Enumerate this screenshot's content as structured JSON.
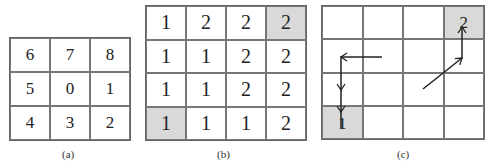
{
  "figure": {
    "panels": [
      {
        "id": "a",
        "caption": "(a)",
        "rows": 3,
        "cols": 3,
        "cells": [
          [
            "6",
            "7",
            "8"
          ],
          [
            "5",
            "0",
            "1"
          ],
          [
            "4",
            "3",
            "2"
          ]
        ],
        "shaded": []
      },
      {
        "id": "b",
        "caption": "(b)",
        "rows": 4,
        "cols": 4,
        "cells": [
          [
            "1",
            "2",
            "2",
            "2"
          ],
          [
            "1",
            "1",
            "2",
            "2"
          ],
          [
            "1",
            "1",
            "2",
            "2"
          ],
          [
            "1",
            "1",
            "1",
            "2"
          ]
        ],
        "shaded": [
          [
            0,
            3
          ],
          [
            3,
            0
          ]
        ]
      },
      {
        "id": "c",
        "caption": "(c)",
        "rows": 4,
        "cols": 4,
        "cells": [
          [
            "",
            "",
            "",
            ""
          ],
          [
            "",
            "",
            "",
            ""
          ],
          [
            "",
            "",
            "",
            ""
          ],
          [
            "",
            "",
            "",
            ""
          ]
        ],
        "shaded": [
          [
            0,
            3
          ],
          [
            3,
            0
          ]
        ],
        "labels": [
          {
            "text": "2",
            "row": 0,
            "col": 3
          },
          {
            "text": "1",
            "row": 3,
            "col": 0
          }
        ],
        "paths": [
          {
            "name": "path-to-1",
            "points": [
              [
                382,
                57
              ],
              [
                341,
                57
              ],
              [
                341,
                128
              ]
            ],
            "color": "#222222"
          },
          {
            "name": "path-to-2",
            "points": [
              [
                423,
                89
              ],
              [
                462,
                58
              ],
              [
                462,
                27
              ]
            ],
            "color": "#222222"
          }
        ]
      }
    ],
    "colors": {
      "shade": "#d9d9d9",
      "grid_line": "#777777",
      "text": "#222222"
    }
  }
}
